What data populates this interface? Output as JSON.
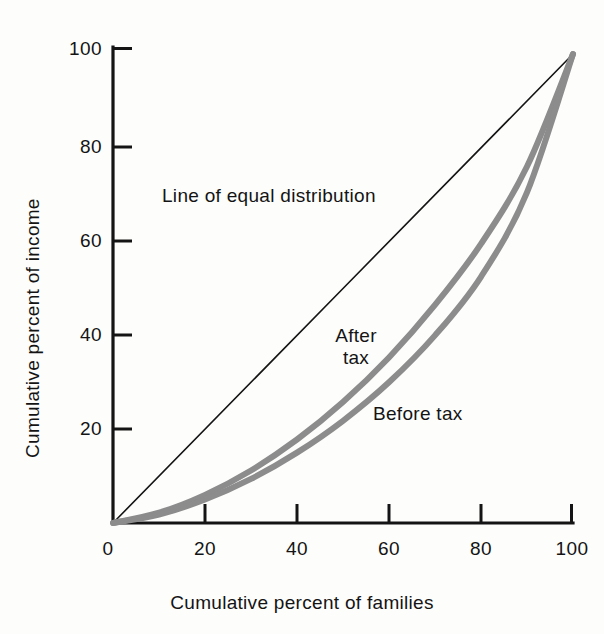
{
  "chart_data": {
    "type": "line",
    "title": "",
    "subtitle": "",
    "xlabel": "Cumulative percent of families",
    "ylabel": "Cumulative percent of income",
    "xlim": [
      0,
      100
    ],
    "ylim": [
      0,
      100
    ],
    "xticks": [
      0,
      20,
      40,
      60,
      80,
      100
    ],
    "yticks": [
      0,
      20,
      40,
      60,
      80,
      100
    ],
    "xtick_labels": [
      "0",
      "20",
      "40",
      "60",
      "80",
      "100"
    ],
    "ytick_labels": [
      "0",
      "20",
      "40",
      "60",
      "80",
      "100"
    ],
    "grid": false,
    "legend_position": "inline-annotations",
    "annotations": [
      {
        "text": "Line of equal distribution",
        "x": 31,
        "y": 67
      },
      {
        "text": "After",
        "x": 53,
        "y": 40
      },
      {
        "text": "tax",
        "x": 53,
        "y": 36
      },
      {
        "text": "Before tax",
        "x": 65,
        "y": 25
      }
    ],
    "series": [
      {
        "name": "Line of equal distribution",
        "color": "#141414",
        "width": 1.6,
        "x": [
          0,
          100
        ],
        "values": [
          0,
          100
        ]
      },
      {
        "name": "After tax",
        "color": "#8c8c8c",
        "width": 6,
        "x": [
          0,
          10,
          20,
          30,
          40,
          50,
          60,
          70,
          80,
          90,
          100
        ],
        "values": [
          0,
          2.2,
          6.0,
          11.2,
          17.8,
          25.8,
          35.3,
          46.5,
          59.5,
          76.0,
          100
        ]
      },
      {
        "name": "Before tax",
        "color": "#8c8c8c",
        "width": 6,
        "x": [
          0,
          10,
          20,
          30,
          40,
          50,
          60,
          70,
          80,
          90,
          100
        ],
        "values": [
          0,
          1.8,
          5.0,
          9.4,
          15.0,
          21.8,
          30.0,
          40.0,
          52.5,
          70.5,
          100
        ]
      }
    ]
  },
  "axes": {
    "y_title": "Cumulative percent of income",
    "x_title": "Cumulative percent of families",
    "y_ticks": [
      {
        "label": "100",
        "value": 100
      },
      {
        "label": "80",
        "value": 80
      },
      {
        "label": "60",
        "value": 60
      },
      {
        "label": "40",
        "value": 40
      },
      {
        "label": "20",
        "value": 20
      }
    ],
    "x_ticks": [
      {
        "label": "0",
        "value": 0
      },
      {
        "label": "20",
        "value": 20
      },
      {
        "label": "40",
        "value": 40
      },
      {
        "label": "60",
        "value": 60
      },
      {
        "label": "80",
        "value": 80
      },
      {
        "label": "100",
        "value": 100
      }
    ]
  },
  "labels": {
    "equal_distribution": "Line of equal distribution",
    "after_line1": "After",
    "after_line2": "tax",
    "before": "Before tax"
  },
  "colors": {
    "axis": "#141414",
    "equal_line": "#141414",
    "curve": "#8c8c8c",
    "background": "#fdfdfc",
    "text": "#141414"
  }
}
